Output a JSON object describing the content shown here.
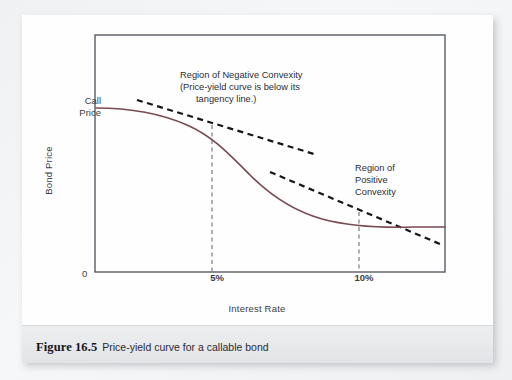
{
  "figure": {
    "caption_label": "Figure 16.5",
    "caption_text": "Price-yield curve for a callable bond"
  },
  "chart_data": {
    "type": "line",
    "title": "Price-yield curve for a callable bond",
    "xlabel": "Interest Rate",
    "ylabel": "Bond Price",
    "grid": false,
    "legend": "none",
    "xlim": [
      0,
      14
    ],
    "ylim": [
      0,
      100
    ],
    "xticks": [
      "0",
      "5%",
      "10%"
    ],
    "xtick_values": [
      0,
      5,
      10
    ],
    "yticks": [
      "Call Price"
    ],
    "ytick_values": [
      72
    ],
    "annotations": [
      {
        "name": "region-negative-convexity",
        "lines": [
          "Region of Negative Convexity",
          "(Price-yield curve is below its",
          "tangency line.)"
        ],
        "x": 6.2,
        "y": 92
      },
      {
        "name": "region-positive-convexity",
        "lines": [
          "Region of",
          "Positive",
          "Convexity"
        ],
        "x": 10.3,
        "y": 52
      }
    ],
    "series": [
      {
        "name": "price-yield-curve",
        "style": "solid",
        "color": "#7a4a52",
        "points": [
          {
            "x": 0.0,
            "y": 72.0
          },
          {
            "x": 1.2,
            "y": 71.6
          },
          {
            "x": 2.4,
            "y": 70.6
          },
          {
            "x": 3.6,
            "y": 68.8
          },
          {
            "x": 5.0,
            "y": 65.0
          },
          {
            "x": 6.2,
            "y": 59.5
          },
          {
            "x": 7.4,
            "y": 52.0
          },
          {
            "x": 8.6,
            "y": 45.0
          },
          {
            "x": 10.0,
            "y": 37.5
          },
          {
            "x": 11.2,
            "y": 33.5
          },
          {
            "x": 12.4,
            "y": 31.5
          },
          {
            "x": 14.0,
            "y": 30.8
          }
        ]
      },
      {
        "name": "tangency-line-at-5-percent",
        "style": "dashed",
        "color": "#16161a",
        "points": [
          {
            "x": 1.7,
            "y": 75.5
          },
          {
            "x": 8.8,
            "y": 52.5
          }
        ]
      },
      {
        "name": "tangency-line-at-10-percent",
        "style": "dashed",
        "color": "#16161a",
        "points": [
          {
            "x": 7.0,
            "y": 52.0
          },
          {
            "x": 13.8,
            "y": 21.5
          }
        ]
      }
    ],
    "reference_lines": [
      {
        "name": "dashed-vline-5-percent",
        "x": 5.0,
        "from_y": 0,
        "to_y": 65.0,
        "style": "dashed"
      },
      {
        "name": "dashed-vline-10-percent",
        "x": 10.0,
        "from_y": 0,
        "to_y": 37.5,
        "style": "dashed"
      }
    ]
  },
  "colors": {
    "curve": "#7a4a52",
    "tangent": "#16161a",
    "axis": "#4a4f57",
    "caption_bg": "#e9eaec",
    "page_bg": "#f3f4f6"
  }
}
